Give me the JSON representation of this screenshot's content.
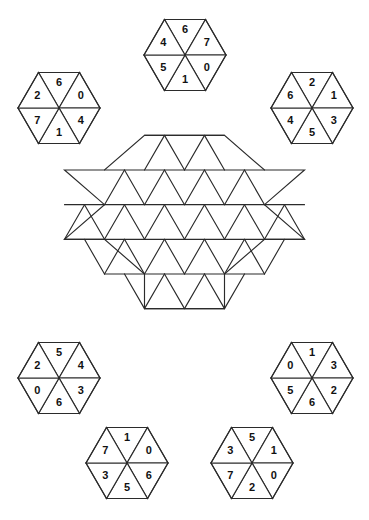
{
  "puzzle": {
    "title": "Hexagon Tile Matching Puzzle",
    "board_name": "hexagram-star-grid",
    "colors": {
      "line": "#2b2b2b",
      "face": "#ffffff",
      "text": "#111111",
      "background": "#ffffff"
    },
    "board": {
      "name": "star-grid",
      "shape": "hexagram",
      "empty": true,
      "triangle_side": 40,
      "rows": [
        120,
        158,
        198,
        238,
        278,
        318
      ]
    },
    "tiles": [
      {
        "id": "tile-top-center",
        "cx": 185,
        "cy": 55,
        "values": {
          "top": "6",
          "upper_left": "4",
          "upper_right": "7",
          "lower_left": "5",
          "bottom": "1",
          "lower_right": "0"
        }
      },
      {
        "id": "tile-top-left",
        "cx": 59,
        "cy": 108,
        "values": {
          "top": "6",
          "upper_left": "2",
          "upper_right": "0",
          "lower_left": "7",
          "bottom": "1",
          "lower_right": "4"
        }
      },
      {
        "id": "tile-top-right",
        "cx": 312,
        "cy": 108,
        "values": {
          "top": "2",
          "upper_left": "6",
          "upper_right": "1",
          "lower_left": "4",
          "bottom": "5",
          "lower_right": "3"
        }
      },
      {
        "id": "tile-mid-left",
        "cx": 59,
        "cy": 378,
        "values": {
          "top": "5",
          "upper_left": "2",
          "upper_right": "4",
          "lower_left": "0",
          "bottom": "6",
          "lower_right": "3"
        }
      },
      {
        "id": "tile-mid-right",
        "cx": 312,
        "cy": 378,
        "values": {
          "top": "1",
          "upper_left": "0",
          "upper_right": "3",
          "lower_left": "5",
          "bottom": "6",
          "lower_right": "2"
        }
      },
      {
        "id": "tile-bottom-left",
        "cx": 127,
        "cy": 463,
        "values": {
          "top": "1",
          "upper_left": "7",
          "upper_right": "0",
          "lower_left": "3",
          "bottom": "5",
          "lower_right": "6"
        }
      },
      {
        "id": "tile-bottom-right",
        "cx": 252,
        "cy": 463,
        "values": {
          "top": "5",
          "upper_left": "3",
          "upper_right": "1",
          "lower_left": "7",
          "bottom": "2",
          "lower_right": "0"
        }
      }
    ]
  }
}
